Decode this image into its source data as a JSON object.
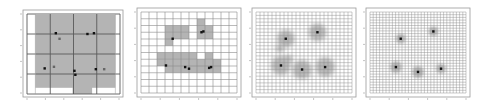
{
  "figure": {
    "panels": [
      {
        "id": "level-1",
        "grid_divisions": 4,
        "shaded_cells": [
          [
            0,
            0
          ],
          [
            1,
            0
          ],
          [
            2,
            0
          ],
          [
            3,
            0
          ],
          [
            0,
            1
          ],
          [
            1,
            1
          ],
          [
            2,
            1
          ],
          [
            3,
            1
          ],
          [
            0,
            2
          ],
          [
            1,
            2
          ],
          [
            2,
            2
          ],
          [
            3,
            2
          ],
          [
            0,
            3
          ],
          [
            1,
            3
          ],
          [
            2,
            3
          ],
          [
            3,
            3
          ],
          [
            2,
            4
          ]
        ],
        "points": [
          [
            0.31,
            0.24
          ],
          [
            0.35,
            0.31
          ],
          [
            0.65,
            0.25
          ],
          [
            0.72,
            0.24
          ],
          [
            0.19,
            0.68
          ],
          [
            0.29,
            0.66
          ],
          [
            0.51,
            0.71
          ],
          [
            0.52,
            0.76
          ],
          [
            0.74,
            0.69
          ],
          [
            0.83,
            0.69
          ]
        ]
      },
      {
        "id": "level-2",
        "grid_divisions": 12,
        "shaded_cells": [
          [
            3,
            2
          ],
          [
            4,
            2
          ],
          [
            5,
            2
          ],
          [
            7,
            1
          ],
          [
            7,
            2
          ],
          [
            8,
            2
          ],
          [
            3,
            3
          ],
          [
            4,
            3
          ],
          [
            5,
            3
          ],
          [
            3,
            4
          ],
          [
            7,
            3
          ],
          [
            8,
            3
          ],
          [
            2,
            6
          ],
          [
            3,
            6
          ],
          [
            4,
            6
          ],
          [
            5,
            6
          ],
          [
            6,
            6
          ],
          [
            8,
            6
          ],
          [
            2,
            7
          ],
          [
            3,
            7
          ],
          [
            4,
            7
          ],
          [
            5,
            7
          ],
          [
            6,
            7
          ],
          [
            7,
            7
          ],
          [
            8,
            7
          ],
          [
            9,
            7
          ],
          [
            3,
            8
          ],
          [
            4,
            8
          ],
          [
            5,
            8
          ],
          [
            6,
            8
          ],
          [
            7,
            8
          ],
          [
            8,
            8
          ],
          [
            9,
            8
          ]
        ],
        "points": [
          [
            0.33,
            0.33
          ],
          [
            0.63,
            0.25
          ],
          [
            0.65,
            0.24
          ],
          [
            0.26,
            0.66
          ],
          [
            0.46,
            0.68
          ],
          [
            0.5,
            0.7
          ],
          [
            0.71,
            0.69
          ],
          [
            0.73,
            0.68
          ]
        ]
      },
      {
        "id": "level-3",
        "grid_divisions": 24,
        "points": [
          [
            0.31,
            0.33
          ],
          [
            0.64,
            0.25
          ],
          [
            0.26,
            0.66
          ],
          [
            0.48,
            0.71
          ],
          [
            0.72,
            0.68
          ]
        ],
        "blobs": [
          {
            "cx": 0.31,
            "cy": 0.33,
            "r": 0.09
          },
          {
            "cx": 0.64,
            "cy": 0.25,
            "r": 0.09
          },
          {
            "cx": 0.26,
            "cy": 0.66,
            "r": 0.1
          },
          {
            "cx": 0.48,
            "cy": 0.71,
            "r": 0.1
          },
          {
            "cx": 0.72,
            "cy": 0.68,
            "r": 0.1
          },
          {
            "cx": 0.25,
            "cy": 0.45,
            "r": 0.04
          },
          {
            "cx": 0.34,
            "cy": 0.58,
            "r": 0.04
          }
        ]
      },
      {
        "id": "level-4",
        "grid_divisions": 30,
        "points": [
          [
            0.32,
            0.33
          ],
          [
            0.66,
            0.24
          ],
          [
            0.27,
            0.68
          ],
          [
            0.5,
            0.74
          ],
          [
            0.74,
            0.7
          ]
        ],
        "blobs": [
          {
            "cx": 0.32,
            "cy": 0.33,
            "r": 0.05
          },
          {
            "cx": 0.66,
            "cy": 0.24,
            "r": 0.05
          },
          {
            "cx": 0.27,
            "cy": 0.68,
            "r": 0.06
          },
          {
            "cx": 0.5,
            "cy": 0.74,
            "r": 0.06
          },
          {
            "cx": 0.74,
            "cy": 0.7,
            "r": 0.05
          }
        ]
      }
    ],
    "colors": {
      "shade": "#b4b4b4",
      "grid_line": "#8c8c8c",
      "coarse_line": "#5a5a5a",
      "frame": "#9a9a9a",
      "point": "#111111",
      "point_alt": "#666666"
    }
  }
}
